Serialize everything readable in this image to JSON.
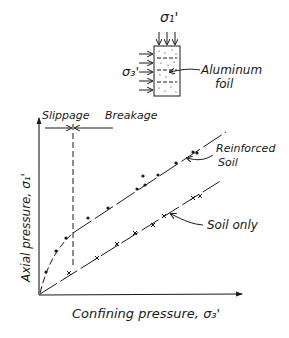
{
  "figure": {
    "specimen": {
      "sigma1_label": "σ₁'",
      "sigma3_label": "σ₃'",
      "foil_label_line1": "Aluminum",
      "foil_label_line2": "foil"
    },
    "regions": {
      "slippage": "Slippage",
      "breakage": "Breakage"
    },
    "curves": {
      "reinforced_line1": "Reinforced",
      "reinforced_line2": "Soil",
      "soil_only": "Soil only"
    },
    "axes": {
      "ylabel": "Axial pressure, σ₁'",
      "xlabel": "Confining pressure, σ₃'"
    },
    "colors": {
      "ink": "#1a1a1a",
      "background": "#ffffff"
    }
  }
}
